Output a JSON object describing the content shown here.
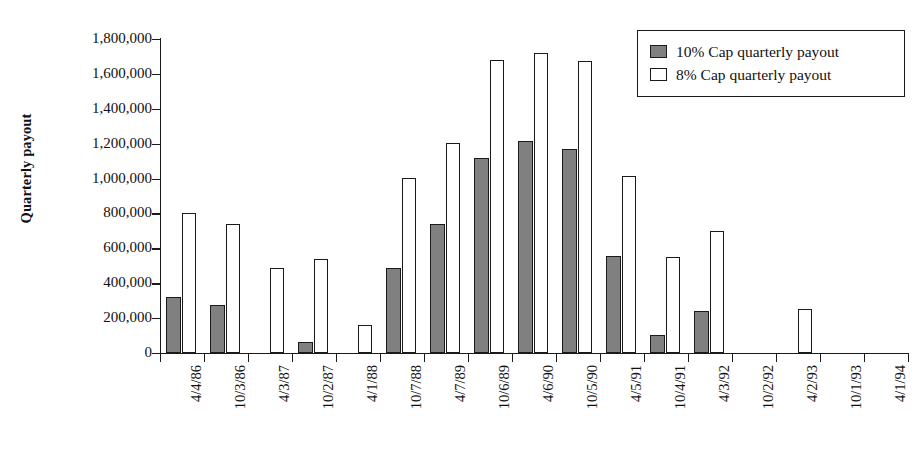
{
  "chart_data": {
    "type": "bar",
    "title": "",
    "xlabel": "",
    "ylabel": "Quarterly payout",
    "ylim": [
      0,
      1800000
    ],
    "yticks": [
      0,
      200000,
      400000,
      600000,
      800000,
      1000000,
      1200000,
      1400000,
      1600000,
      1800000
    ],
    "ytick_labels": [
      "0",
      "200,000",
      "400,000",
      "600,000",
      "800,000",
      "1,000,000",
      "1,200,000",
      "1,400,000",
      "1,600,000",
      "1,800,000"
    ],
    "grid": false,
    "legend_position": "top-right",
    "categories": [
      "4/4/86",
      "10/3/86",
      "4/3/87",
      "10/2/87",
      "4/1/88",
      "10/7/88",
      "4/7/89",
      "10/6/89",
      "4/6/90",
      "10/5/90",
      "4/5/91",
      "10/4/91",
      "4/3/92",
      "10/2/92",
      "4/2/93",
      "10/1/93",
      "4/1/94"
    ],
    "series": [
      {
        "name": "10% Cap quarterly payout",
        "color": "#808080",
        "values": [
          320000,
          275000,
          0,
          65000,
          0,
          490000,
          740000,
          1120000,
          1215000,
          1170000,
          555000,
          105000,
          240000,
          0,
          0,
          0,
          0
        ]
      },
      {
        "name": "8% Cap quarterly payout",
        "color": "#ffffff",
        "values": [
          800000,
          740000,
          490000,
          540000,
          160000,
          1005000,
          1205000,
          1680000,
          1720000,
          1675000,
          1015000,
          550000,
          700000,
          0,
          255000,
          0,
          0
        ]
      }
    ]
  },
  "legend": {
    "items": [
      {
        "label": "10% Cap quarterly payout",
        "swatch": "series-gray"
      },
      {
        "label": "8% Cap quarterly payout",
        "swatch": "series-white"
      }
    ]
  }
}
